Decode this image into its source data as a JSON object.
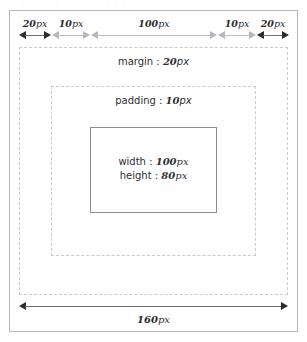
{
  "figure": {
    "title_strip": "· · ·   · ·  ·  ·        · ·  ·  · ·           · ·  · ·",
    "top_ruler": {
      "segments": [
        {
          "name": "margin-left",
          "value": "20",
          "unit": "px",
          "emphasis": "dark"
        },
        {
          "name": "padding-left",
          "value": "10",
          "unit": "px",
          "emphasis": "light"
        },
        {
          "name": "content-width",
          "value": "100",
          "unit": "px",
          "emphasis": "light"
        },
        {
          "name": "padding-right",
          "value": "10",
          "unit": "px",
          "emphasis": "light"
        },
        {
          "name": "margin-right",
          "value": "20",
          "unit": "px",
          "emphasis": "dark"
        }
      ]
    },
    "bottom_ruler": {
      "total_value": "160",
      "total_unit": "px"
    },
    "margin_box": {
      "keyword": "margin",
      "separator": " : ",
      "value": "20",
      "unit": "px"
    },
    "padding_box": {
      "keyword": "padding",
      "separator": " : ",
      "value": "10",
      "unit": "px"
    },
    "content_box": {
      "width_keyword": "width",
      "width_separator": " : ",
      "width_value": "100",
      "width_unit": "px",
      "height_keyword": "height",
      "height_separator": " : ",
      "height_value": "80",
      "height_unit": "px"
    },
    "colors": {
      "frame": "#b9b9bd",
      "dashed": "#c9c9cf",
      "content_border": "#8d8d93",
      "arrow_dark": "#2b2b30",
      "arrow_light": "#b6b6be",
      "text": "#2e2e32",
      "background": "#ffffff"
    }
  }
}
